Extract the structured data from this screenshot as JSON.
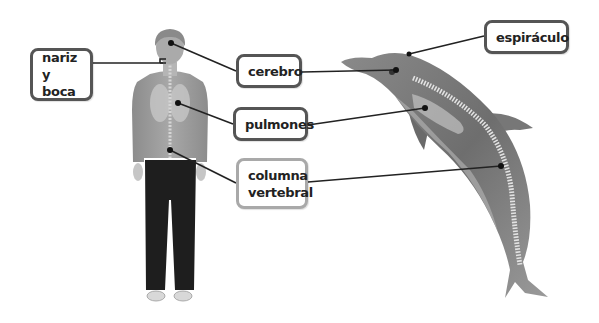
{
  "diagram": {
    "subjects": [
      "human",
      "dolphin"
    ],
    "labels": [
      {
        "id": "nariz-y-boca",
        "line1": "nariz y",
        "line2": "boca",
        "box": {
          "x": 30,
          "y": 48,
          "w": 63,
          "h": 53
        },
        "style": "dark"
      },
      {
        "id": "cerebro",
        "line1": "cerebro",
        "line2": "",
        "box": {
          "x": 236,
          "y": 54,
          "w": 66,
          "h": 34
        },
        "style": "dark"
      },
      {
        "id": "pulmones",
        "line1": "pulmones",
        "line2": "",
        "box": {
          "x": 233,
          "y": 107,
          "w": 75,
          "h": 34
        },
        "style": "dark"
      },
      {
        "id": "columna-vertebral",
        "line1": "columna",
        "line2": "vertebral",
        "box": {
          "x": 236,
          "y": 158,
          "w": 72,
          "h": 51
        },
        "style": "light"
      },
      {
        "id": "espiraculo",
        "line1": "espiráculo",
        "line2": "",
        "box": {
          "x": 484,
          "y": 20,
          "w": 85,
          "h": 34
        },
        "style": "dark"
      }
    ],
    "leader_lines": [
      {
        "label": "nariz-y-boca",
        "from": [
          93,
          63
        ],
        "to": [
          163,
          63
        ],
        "bracket": true
      },
      {
        "label": "cerebro",
        "from": [
          236,
          71
        ],
        "to": [
          171,
          43
        ]
      },
      {
        "label": "cerebro",
        "from": [
          302,
          72
        ],
        "to": [
          396,
          70
        ]
      },
      {
        "label": "pulmones",
        "from": [
          233,
          124
        ],
        "to": [
          178,
          103
        ]
      },
      {
        "label": "pulmones",
        "from": [
          308,
          125
        ],
        "to": [
          425,
          108
        ]
      },
      {
        "label": "columna-vertebral",
        "from": [
          236,
          183
        ],
        "to": [
          170,
          150
        ]
      },
      {
        "label": "columna-vertebral",
        "from": [
          308,
          182
        ],
        "to": [
          501,
          166
        ]
      },
      {
        "label": "espiraculo",
        "from": [
          484,
          36
        ],
        "to": [
          409,
          54
        ]
      }
    ],
    "colors": {
      "line": "#222222",
      "box_border_dark": "#555555",
      "box_border_light": "#a9a9a9",
      "text": "#222222",
      "background": "#ffffff"
    }
  }
}
